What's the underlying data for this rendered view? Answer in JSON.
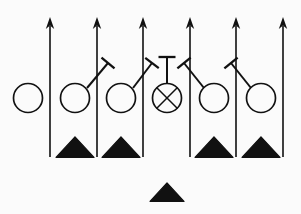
{
  "diagram": {
    "type": "american-football-play-schematic",
    "background_color": "#fbfbfb",
    "ink_color": "#111111",
    "width": 301,
    "height": 214,
    "legend": {
      "circle": "offensive lineman",
      "circle_with_x": "center (ball snapper)",
      "filled_triangle": "defensive player",
      "vertical_arrow": "rush / release path upfield",
      "t_capped_line": "block assignment"
    },
    "counts": {
      "offense_circles": 7,
      "defense_triangles": 5,
      "rush_arrows": 6,
      "block_lines": 5
    }
  },
  "offense": {
    "label": "Offensive linemen",
    "players": [
      {
        "id": "o1",
        "name": "left-wide-lineman",
        "symbol": "circle",
        "cx": 28,
        "cy": 98,
        "r": 14.5,
        "has_x": false
      },
      {
        "id": "o2",
        "name": "left-tackle",
        "symbol": "circle",
        "cx": 75,
        "cy": 98,
        "r": 14.5,
        "has_x": false
      },
      {
        "id": "o3",
        "name": "left-guard",
        "symbol": "circle",
        "cx": 121,
        "cy": 98,
        "r": 14.5,
        "has_x": false
      },
      {
        "id": "o4",
        "name": "center",
        "symbol": "circle-x",
        "cx": 167,
        "cy": 98,
        "r": 14.5,
        "has_x": true
      },
      {
        "id": "o5",
        "name": "right-guard",
        "symbol": "circle",
        "cx": 214,
        "cy": 98,
        "r": 14.5,
        "has_x": false
      },
      {
        "id": "o6",
        "name": "right-tackle",
        "symbol": "circle",
        "cx": 261,
        "cy": 98,
        "r": 14.5,
        "has_x": false
      }
    ]
  },
  "defense": {
    "label": "Defensive players",
    "players": [
      {
        "id": "d1",
        "name": "defender-left-inside",
        "symbol": "triangle",
        "cx": 75,
        "cy": 148,
        "size": 19
      },
      {
        "id": "d2",
        "name": "defender-left-outside",
        "symbol": "triangle",
        "cx": 121,
        "cy": 148,
        "size": 19
      },
      {
        "id": "d3",
        "name": "defender-right-inside",
        "symbol": "triangle",
        "cx": 214,
        "cy": 148,
        "size": 19
      },
      {
        "id": "d4",
        "name": "defender-right-outside",
        "symbol": "triangle",
        "cx": 261,
        "cy": 148,
        "size": 19
      },
      {
        "id": "d5",
        "name": "defender-deep-middle",
        "symbol": "triangle",
        "cx": 167,
        "cy": 193,
        "size": 17
      }
    ]
  },
  "routes": {
    "label": "Rush lanes (vertical arrows)",
    "arrows": [
      {
        "id": "a1",
        "name": "rush-lane-1",
        "x": 50,
        "y_bottom": 157,
        "y_top": 17
      },
      {
        "id": "a2",
        "name": "rush-lane-2",
        "x": 97,
        "y_bottom": 157,
        "y_top": 17
      },
      {
        "id": "a3",
        "name": "rush-lane-3",
        "x": 143,
        "y_bottom": 157,
        "y_top": 17
      },
      {
        "id": "a4",
        "name": "rush-lane-4",
        "x": 190,
        "y_bottom": 157,
        "y_top": 17
      },
      {
        "id": "a5",
        "name": "rush-lane-5",
        "x": 236,
        "y_bottom": 157,
        "y_top": 17
      },
      {
        "id": "a6",
        "name": "rush-lane-6",
        "x": 283,
        "y_bottom": 157,
        "y_top": 17
      }
    ]
  },
  "blocks": {
    "label": "Block assignments (T-capped lines)",
    "assignments": [
      {
        "id": "b1",
        "name": "block-left-tackle-to-lane2",
        "x1": 87,
        "y1": 88,
        "x2": 108,
        "y2": 63,
        "cap_angle": 42
      },
      {
        "id": "b2",
        "name": "block-left-guard-to-lane3",
        "x1": 133,
        "y1": 88,
        "x2": 152,
        "y2": 63,
        "cap_angle": 42
      },
      {
        "id": "b3",
        "name": "center-snap-stem",
        "x1": 167,
        "y1": 83,
        "x2": 167,
        "y2": 57,
        "cap_angle": 0
      },
      {
        "id": "b4",
        "name": "block-right-guard-to-lane4",
        "x1": 204,
        "y1": 88,
        "x2": 184,
        "y2": 63,
        "cap_angle": -42
      },
      {
        "id": "b5",
        "name": "block-right-tackle-to-lane5",
        "x1": 251,
        "y1": 88,
        "x2": 231,
        "y2": 63,
        "cap_angle": -42
      }
    ]
  }
}
